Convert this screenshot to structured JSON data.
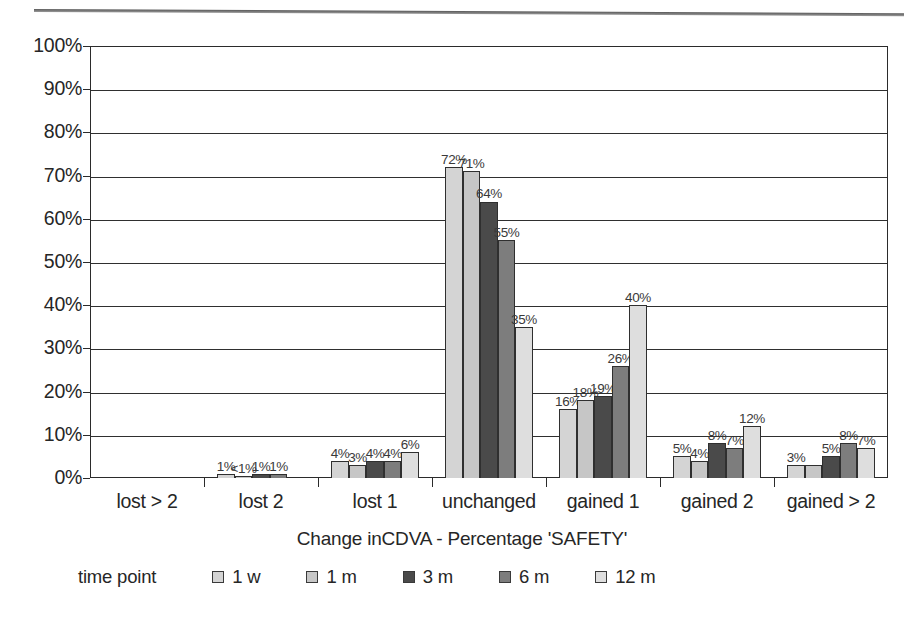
{
  "chart_data": {
    "type": "bar",
    "title": "",
    "xlabel": "Change inCDVA - Percentage 'SAFETY'",
    "ylabel": "",
    "ylim": [
      0,
      100
    ],
    "ytick_labels": [
      "100%",
      "90%",
      "80%",
      "70%",
      "60%",
      "50%",
      "40%",
      "30%",
      "20%",
      "10%",
      "0%"
    ],
    "ytick_values": [
      100,
      90,
      80,
      70,
      60,
      50,
      40,
      30,
      20,
      10,
      0
    ],
    "grid": "horizontal",
    "legend_position": "bottom",
    "legend_title": "time point",
    "categories": [
      "lost > 2",
      "lost 2",
      "lost 1",
      "unchanged",
      "gained 1",
      "gained 2",
      "gained > 2"
    ],
    "series": [
      {
        "name": "1 w",
        "color": "#d4d4d4",
        "values": [
          0,
          1,
          4,
          72,
          16,
          5,
          3
        ],
        "labels": [
          "",
          "1%",
          "4%",
          "72%",
          "16%",
          "5%",
          "3%"
        ]
      },
      {
        "name": "1 m",
        "color": "#c6c6c6",
        "values": [
          0,
          0.4,
          3,
          71,
          18,
          4,
          3
        ],
        "labels": [
          "",
          "<1%",
          "3%",
          "71%",
          "18%",
          "4%",
          ""
        ]
      },
      {
        "name": "3 m",
        "color": "#4a4a4a",
        "values": [
          0,
          1,
          4,
          64,
          19,
          8,
          5
        ],
        "labels": [
          "",
          "1%",
          "4%",
          "64%",
          "19%",
          "8%",
          "5%"
        ]
      },
      {
        "name": "6 m",
        "color": "#7d7d7d",
        "values": [
          0,
          1,
          4,
          55,
          26,
          7,
          8
        ],
        "labels": [
          "",
          "1%",
          "4%",
          "55%",
          "26%",
          "7%",
          "8%"
        ]
      },
      {
        "name": "12 m",
        "color": "#dedede",
        "values": [
          0,
          0,
          6,
          35,
          40,
          12,
          7
        ],
        "labels": [
          "",
          "",
          "6%",
          "35%",
          "40%",
          "12%",
          "7%"
        ]
      }
    ]
  }
}
